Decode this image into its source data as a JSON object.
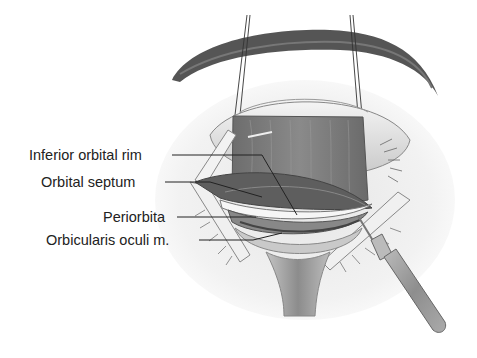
{
  "figure": {
    "labels": [
      {
        "id": "inferior-orbital-rim",
        "text": "Inferior orbital rim"
      },
      {
        "id": "orbital-septum",
        "text": "Orbital septum"
      },
      {
        "id": "periorbita",
        "text": "Periorbita"
      },
      {
        "id": "orbicularis-oculi",
        "text": "Orbicularis oculi m."
      }
    ]
  }
}
